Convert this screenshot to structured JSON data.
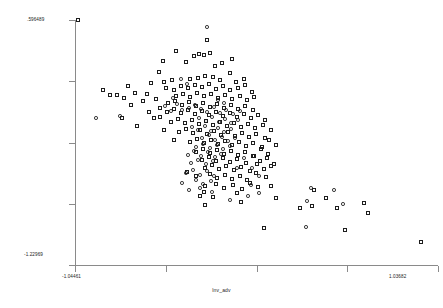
{
  "chart_data": {
    "type": "scatter",
    "title": "",
    "xlabel": "lnv_adv",
    "ylabel": "",
    "xlim": [
      -1.04461,
      1.03682
    ],
    "ylim": [
      -1.22969,
      0.596489
    ],
    "x_tick_labels": [
      "-1.04461",
      "1.03682"
    ],
    "y_tick_labels": [
      ".596489",
      "-1.22969"
    ],
    "x_tick_count": 5,
    "y_tick_count": 5,
    "grid": false,
    "legend": "none",
    "marker_color": "#1d1d1d",
    "background": "#ffffff",
    "series": [
      {
        "name": "square-markers",
        "marker": "open-square",
        "points": [
          [
            78,
            20
          ],
          [
            207,
            40
          ],
          [
            176,
            51
          ],
          [
            163,
            61
          ],
          [
            194,
            56
          ],
          [
            199,
            54
          ],
          [
            204,
            55
          ],
          [
            210,
            53
          ],
          [
            232,
            59
          ],
          [
            186,
            62
          ],
          [
            222,
            63
          ],
          [
            215,
            66
          ],
          [
            103,
            90
          ],
          [
            159,
            72
          ],
          [
            172,
            80
          ],
          [
            230,
            73
          ],
          [
            117,
            95
          ],
          [
            151,
            83
          ],
          [
            164,
            82
          ],
          [
            190,
            79
          ],
          [
            198,
            78
          ],
          [
            205,
            76
          ],
          [
            213,
            77
          ],
          [
            220,
            80
          ],
          [
            236,
            82
          ],
          [
            244,
            79
          ],
          [
            166,
            88
          ],
          [
            174,
            90
          ],
          [
            181,
            86
          ],
          [
            188,
            88
          ],
          [
            195,
            85
          ],
          [
            202,
            87
          ],
          [
            209,
            84
          ],
          [
            216,
            89
          ],
          [
            223,
            86
          ],
          [
            230,
            90
          ],
          [
            238,
            88
          ],
          [
            245,
            85
          ],
          [
            252,
            92
          ],
          [
            176,
            96
          ],
          [
            183,
            94
          ],
          [
            190,
            97
          ],
          [
            197,
            93
          ],
          [
            204,
            96
          ],
          [
            211,
            94
          ],
          [
            218,
            98
          ],
          [
            225,
            95
          ],
          [
            232,
            99
          ],
          [
            240,
            96
          ],
          [
            247,
            100
          ],
          [
            254,
            97
          ],
          [
            168,
            103
          ],
          [
            175,
            101
          ],
          [
            182,
            105
          ],
          [
            189,
            102
          ],
          [
            196,
            106
          ],
          [
            203,
            103
          ],
          [
            210,
            107
          ],
          [
            217,
            104
          ],
          [
            224,
            108
          ],
          [
            231,
            105
          ],
          [
            238,
            109
          ],
          [
            245,
            106
          ],
          [
            253,
            110
          ],
          [
            160,
            108
          ],
          [
            167,
            112
          ],
          [
            174,
            109
          ],
          [
            181,
            113
          ],
          [
            188,
            110
          ],
          [
            195,
            114
          ],
          [
            202,
            111
          ],
          [
            209,
            115
          ],
          [
            216,
            112
          ],
          [
            223,
            116
          ],
          [
            230,
            113
          ],
          [
            237,
            117
          ],
          [
            244,
            114
          ],
          [
            251,
            118
          ],
          [
            258,
            115
          ],
          [
            265,
            120
          ],
          [
            154,
            118
          ],
          [
            171,
            122
          ],
          [
            178,
            119
          ],
          [
            185,
            123
          ],
          [
            192,
            120
          ],
          [
            199,
            124
          ],
          [
            206,
            121
          ],
          [
            213,
            125
          ],
          [
            220,
            122
          ],
          [
            227,
            126
          ],
          [
            234,
            123
          ],
          [
            241,
            127
          ],
          [
            248,
            124
          ],
          [
            255,
            128
          ],
          [
            263,
            125
          ],
          [
            164,
            130
          ],
          [
            179,
            132
          ],
          [
            186,
            129
          ],
          [
            193,
            133
          ],
          [
            200,
            130
          ],
          [
            207,
            134
          ],
          [
            214,
            131
          ],
          [
            221,
            135
          ],
          [
            228,
            132
          ],
          [
            235,
            136
          ],
          [
            242,
            133
          ],
          [
            249,
            137
          ],
          [
            256,
            134
          ],
          [
            265,
            138
          ],
          [
            271,
            130
          ],
          [
            174,
            140
          ],
          [
            190,
            142
          ],
          [
            197,
            139
          ],
          [
            204,
            143
          ],
          [
            211,
            140
          ],
          [
            218,
            144
          ],
          [
            225,
            141
          ],
          [
            232,
            145
          ],
          [
            239,
            142
          ],
          [
            246,
            146
          ],
          [
            253,
            143
          ],
          [
            262,
            147
          ],
          [
            269,
            140
          ],
          [
            276,
            145
          ],
          [
            196,
            152
          ],
          [
            203,
            149
          ],
          [
            210,
            153
          ],
          [
            217,
            150
          ],
          [
            224,
            154
          ],
          [
            231,
            151
          ],
          [
            238,
            155
          ],
          [
            245,
            152
          ],
          [
            254,
            156
          ],
          [
            261,
            149
          ],
          [
            268,
            154
          ],
          [
            202,
            160
          ],
          [
            209,
            157
          ],
          [
            216,
            161
          ],
          [
            223,
            158
          ],
          [
            230,
            162
          ],
          [
            237,
            159
          ],
          [
            246,
            163
          ],
          [
            253,
            156
          ],
          [
            260,
            161
          ],
          [
            267,
            158
          ],
          [
            274,
            164
          ],
          [
            205,
            168
          ],
          [
            212,
            165
          ],
          [
            219,
            169
          ],
          [
            226,
            166
          ],
          [
            234,
            170
          ],
          [
            241,
            167
          ],
          [
            250,
            171
          ],
          [
            257,
            164
          ],
          [
            264,
            169
          ],
          [
            271,
            166
          ],
          [
            187,
            172
          ],
          [
            196,
            176
          ],
          [
            210,
            174
          ],
          [
            217,
            178
          ],
          [
            225,
            175
          ],
          [
            232,
            179
          ],
          [
            240,
            176
          ],
          [
            247,
            180
          ],
          [
            256,
            173
          ],
          [
            266,
            177
          ],
          [
            205,
            186
          ],
          [
            216,
            184
          ],
          [
            224,
            188
          ],
          [
            233,
            185
          ],
          [
            242,
            189
          ],
          [
            250,
            183
          ],
          [
            258,
            187
          ],
          [
            200,
            196
          ],
          [
            204,
            192
          ],
          [
            213,
            197
          ],
          [
            237,
            193
          ],
          [
            271,
            186
          ],
          [
            314,
            190
          ],
          [
            276,
            198
          ],
          [
            205,
            205
          ],
          [
            241,
            202
          ],
          [
            300,
            208
          ],
          [
            312,
            206
          ],
          [
            326,
            198
          ],
          [
            337,
            208
          ],
          [
            364,
            203
          ],
          [
            368,
            213
          ],
          [
            264,
            228
          ],
          [
            345,
            230
          ],
          [
            421,
            242
          ],
          [
            110,
            95
          ],
          [
            124,
            98
          ],
          [
            128,
            86
          ],
          [
            135,
            93
          ],
          [
            143,
            101
          ],
          [
            149,
            112
          ],
          [
            122,
            118
          ],
          [
            137,
            126
          ],
          [
            156,
            99
          ],
          [
            147,
            94
          ],
          [
            131,
            105
          ],
          [
            160,
            117
          ]
        ]
      },
      {
        "name": "circle-markers",
        "marker": "open-circle",
        "points": [
          [
            207,
            27
          ],
          [
            96,
            118
          ],
          [
            120,
            116
          ],
          [
            181,
            79
          ],
          [
            187,
            84
          ],
          [
            173,
            98
          ],
          [
            177,
            104
          ],
          [
            182,
            110
          ],
          [
            189,
            108
          ],
          [
            195,
            105
          ],
          [
            201,
            109
          ],
          [
            207,
            112
          ],
          [
            214,
            107
          ],
          [
            220,
            113
          ],
          [
            226,
            110
          ],
          [
            233,
            114
          ],
          [
            240,
            111
          ],
          [
            199,
            118
          ],
          [
            206,
            121
          ],
          [
            212,
            117
          ],
          [
            219,
            122
          ],
          [
            225,
            119
          ],
          [
            231,
            123
          ],
          [
            238,
            120
          ],
          [
            192,
            127
          ],
          [
            198,
            130
          ],
          [
            205,
            126
          ],
          [
            211,
            131
          ],
          [
            218,
            128
          ],
          [
            224,
            132
          ],
          [
            231,
            129
          ],
          [
            202,
            138
          ],
          [
            209,
            135
          ],
          [
            215,
            140
          ],
          [
            222,
            137
          ],
          [
            228,
            141
          ],
          [
            235,
            138
          ],
          [
            196,
            147
          ],
          [
            203,
            144
          ],
          [
            210,
            148
          ],
          [
            217,
            145
          ],
          [
            223,
            149
          ],
          [
            230,
            146
          ],
          [
            188,
            155
          ],
          [
            194,
            151
          ],
          [
            201,
            156
          ],
          [
            208,
            152
          ],
          [
            215,
            157
          ],
          [
            221,
            154
          ],
          [
            191,
            163
          ],
          [
            198,
            160
          ],
          [
            206,
            164
          ],
          [
            213,
            161
          ],
          [
            186,
            173
          ],
          [
            193,
            170
          ],
          [
            200,
            175
          ],
          [
            207,
            171
          ],
          [
            214,
            176
          ],
          [
            182,
            183
          ],
          [
            196,
            180
          ],
          [
            203,
            184
          ],
          [
            211,
            181
          ],
          [
            189,
            190
          ],
          [
            200,
            188
          ],
          [
            212,
            192
          ],
          [
            251,
            185
          ],
          [
            259,
            193
          ],
          [
            230,
            200
          ],
          [
            248,
            196
          ],
          [
            311,
            188
          ],
          [
            334,
            190
          ],
          [
            307,
            201
          ],
          [
            343,
            204
          ],
          [
            306,
            227
          ],
          [
            244,
            158
          ],
          [
            237,
            168
          ],
          [
            252,
            168
          ],
          [
            259,
            176
          ],
          [
            218,
            100
          ],
          [
            224,
            103
          ],
          [
            165,
            106
          ],
          [
            171,
            111
          ]
        ]
      }
    ]
  }
}
